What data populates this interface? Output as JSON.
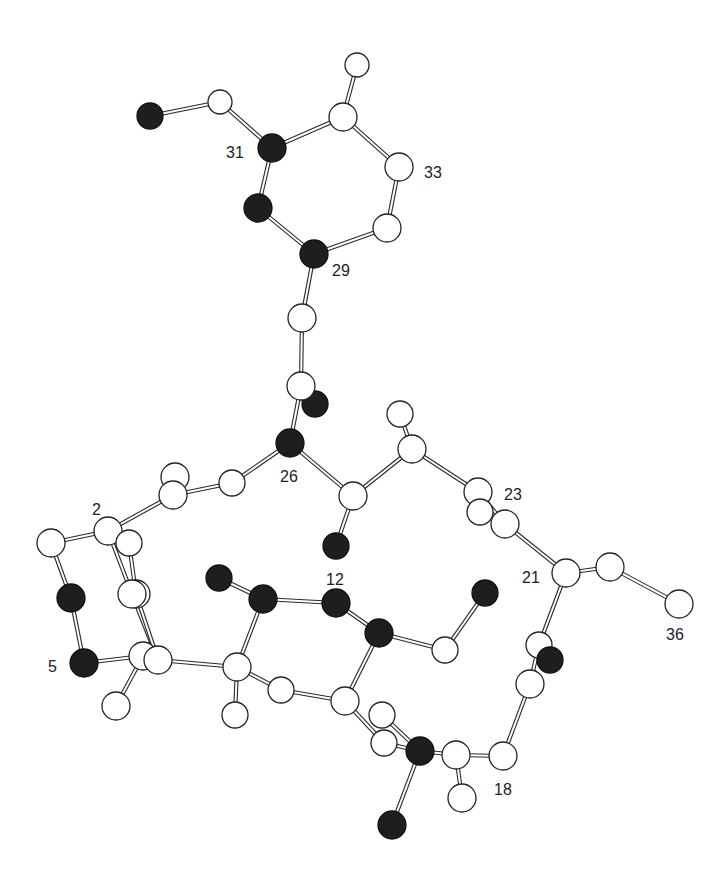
{
  "figure": {
    "type": "ball-and-stick molecular structure",
    "colors": {
      "background": "#ffffff",
      "light_atom": "#ffffff",
      "dark_atom": "#1e1e1e",
      "bond_outline": "#2a2a2a"
    }
  },
  "labels": [
    {
      "id": "lbl-31",
      "text": "31",
      "x": 226,
      "y": 158
    },
    {
      "id": "lbl-33",
      "text": "33",
      "x": 424,
      "y": 178
    },
    {
      "id": "lbl-29",
      "text": "29",
      "x": 332,
      "y": 276
    },
    {
      "id": "lbl-26",
      "text": "26",
      "x": 280,
      "y": 482
    },
    {
      "id": "lbl-23",
      "text": "23",
      "x": 504,
      "y": 500
    },
    {
      "id": "lbl-2",
      "text": "2",
      "x": 92,
      "y": 515
    },
    {
      "id": "lbl-12",
      "text": "12",
      "x": 326,
      "y": 585
    },
    {
      "id": "lbl-21",
      "text": "21",
      "x": 522,
      "y": 583
    },
    {
      "id": "lbl-36",
      "text": "36",
      "x": 666,
      "y": 640
    },
    {
      "id": "lbl-5",
      "text": "5",
      "x": 48,
      "y": 672
    },
    {
      "id": "lbl-18",
      "text": "18",
      "x": 494,
      "y": 795
    }
  ],
  "atoms": [
    {
      "id": "a1",
      "x": 150,
      "y": 116,
      "r": 13,
      "dark": true
    },
    {
      "id": "a2",
      "x": 220,
      "y": 102,
      "r": 12,
      "dark": false
    },
    {
      "id": "a3",
      "x": 357,
      "y": 65,
      "r": 12,
      "dark": false
    },
    {
      "id": "a4",
      "x": 343,
      "y": 117,
      "r": 14,
      "dark": false
    },
    {
      "id": "a31",
      "x": 272,
      "y": 148,
      "r": 14,
      "dark": true
    },
    {
      "id": "a33",
      "x": 399,
      "y": 167,
      "r": 14,
      "dark": false
    },
    {
      "id": "a5r",
      "x": 258,
      "y": 208,
      "r": 14,
      "dark": true
    },
    {
      "id": "a6r",
      "x": 387,
      "y": 228,
      "r": 14,
      "dark": false
    },
    {
      "id": "a29",
      "x": 314,
      "y": 254,
      "r": 14,
      "dark": true
    },
    {
      "id": "a7",
      "x": 302,
      "y": 318,
      "r": 14,
      "dark": false
    },
    {
      "id": "a8o",
      "x": 315,
      "y": 404,
      "r": 13,
      "dark": true
    },
    {
      "id": "a8",
      "x": 301,
      "y": 386,
      "r": 14,
      "dark": false
    },
    {
      "id": "a9",
      "x": 400,
      "y": 414,
      "r": 13,
      "dark": false
    },
    {
      "id": "a26",
      "x": 290,
      "y": 443,
      "r": 14,
      "dark": true
    },
    {
      "id": "a10",
      "x": 412,
      "y": 449,
      "r": 14,
      "dark": false
    },
    {
      "id": "a11",
      "x": 175,
      "y": 477,
      "r": 14,
      "dark": false
    },
    {
      "id": "a12",
      "x": 232,
      "y": 483,
      "r": 13,
      "dark": false
    },
    {
      "id": "a13",
      "x": 173,
      "y": 495,
      "r": 14,
      "dark": false
    },
    {
      "id": "a14",
      "x": 353,
      "y": 496,
      "r": 14,
      "dark": false
    },
    {
      "id": "a23",
      "x": 478,
      "y": 492,
      "r": 14,
      "dark": false
    },
    {
      "id": "a15",
      "x": 480,
      "y": 512,
      "r": 13,
      "dark": false
    },
    {
      "id": "a16",
      "x": 505,
      "y": 524,
      "r": 14,
      "dark": false
    },
    {
      "id": "a2n",
      "x": 108,
      "y": 531,
      "r": 14,
      "dark": false
    },
    {
      "id": "a17",
      "x": 129,
      "y": 543,
      "r": 13,
      "dark": false
    },
    {
      "id": "a18",
      "x": 51,
      "y": 543,
      "r": 14,
      "dark": false
    },
    {
      "id": "a19o",
      "x": 336,
      "y": 546,
      "r": 13,
      "dark": true
    },
    {
      "id": "a21",
      "x": 566,
      "y": 573,
      "r": 14,
      "dark": false
    },
    {
      "id": "a20",
      "x": 610,
      "y": 567,
      "r": 14,
      "dark": false
    },
    {
      "id": "a22",
      "x": 219,
      "y": 578,
      "r": 13,
      "dark": true
    },
    {
      "id": "a12a",
      "x": 263,
      "y": 599,
      "r": 14,
      "dark": true
    },
    {
      "id": "a24",
      "x": 336,
      "y": 603,
      "r": 14,
      "dark": true
    },
    {
      "id": "a25",
      "x": 71,
      "y": 598,
      "r": 14,
      "dark": true
    },
    {
      "id": "a27",
      "x": 485,
      "y": 593,
      "r": 13,
      "dark": true
    },
    {
      "id": "a28",
      "x": 136,
      "y": 594,
      "r": 14,
      "dark": false
    },
    {
      "id": "a36",
      "x": 679,
      "y": 604,
      "r": 14,
      "dark": false
    },
    {
      "id": "a30",
      "x": 132,
      "y": 594,
      "r": 14,
      "dark": false
    },
    {
      "id": "a32",
      "x": 379,
      "y": 633,
      "r": 14,
      "dark": true
    },
    {
      "id": "a34",
      "x": 445,
      "y": 650,
      "r": 13,
      "dark": false
    },
    {
      "id": "a35",
      "x": 539,
      "y": 645,
      "r": 13,
      "dark": false
    },
    {
      "id": "a37",
      "x": 550,
      "y": 660,
      "r": 13,
      "dark": true
    },
    {
      "id": "a5",
      "x": 84,
      "y": 663,
      "r": 14,
      "dark": true
    },
    {
      "id": "a38",
      "x": 143,
      "y": 656,
      "r": 14,
      "dark": false
    },
    {
      "id": "a39",
      "x": 158,
      "y": 660,
      "r": 14,
      "dark": false
    },
    {
      "id": "a40",
      "x": 237,
      "y": 667,
      "r": 14,
      "dark": false
    },
    {
      "id": "a41",
      "x": 530,
      "y": 684,
      "r": 14,
      "dark": false
    },
    {
      "id": "a42",
      "x": 281,
      "y": 690,
      "r": 13,
      "dark": false
    },
    {
      "id": "a43",
      "x": 345,
      "y": 701,
      "r": 14,
      "dark": false
    },
    {
      "id": "a44",
      "x": 116,
      "y": 706,
      "r": 14,
      "dark": false
    },
    {
      "id": "a45",
      "x": 235,
      "y": 715,
      "r": 13,
      "dark": false
    },
    {
      "id": "a46",
      "x": 382,
      "y": 715,
      "r": 13,
      "dark": false
    },
    {
      "id": "a47",
      "x": 384,
      "y": 743,
      "r": 13,
      "dark": false
    },
    {
      "id": "a48",
      "x": 420,
      "y": 751,
      "r": 14,
      "dark": true
    },
    {
      "id": "a49",
      "x": 456,
      "y": 755,
      "r": 14,
      "dark": false
    },
    {
      "id": "a18n",
      "x": 503,
      "y": 756,
      "r": 14,
      "dark": false
    },
    {
      "id": "a50",
      "x": 462,
      "y": 798,
      "r": 14,
      "dark": false
    },
    {
      "id": "a51",
      "x": 392,
      "y": 825,
      "r": 14,
      "dark": true
    }
  ],
  "bonds": [
    [
      "a1",
      "a2"
    ],
    [
      "a2",
      "a31"
    ],
    [
      "a31",
      "a4"
    ],
    [
      "a4",
      "a3"
    ],
    [
      "a4",
      "a33"
    ],
    [
      "a31",
      "a5r"
    ],
    [
      "a5r",
      "a29"
    ],
    [
      "a33",
      "a6r"
    ],
    [
      "a6r",
      "a29"
    ],
    [
      "a29",
      "a7"
    ],
    [
      "a7",
      "a8"
    ],
    [
      "a8",
      "a26"
    ],
    [
      "a26",
      "a12"
    ],
    [
      "a26",
      "a14"
    ],
    [
      "a14",
      "a10"
    ],
    [
      "a10",
      "a9"
    ],
    [
      "a10",
      "a23"
    ],
    [
      "a23",
      "a16"
    ],
    [
      "a16",
      "a21"
    ],
    [
      "a21",
      "a20"
    ],
    [
      "a20",
      "a36"
    ],
    [
      "a14",
      "a19o"
    ],
    [
      "a12",
      "a13"
    ],
    [
      "a13",
      "a2n"
    ],
    [
      "a2n",
      "a18"
    ],
    [
      "a18",
      "a25"
    ],
    [
      "a25",
      "a5"
    ],
    [
      "a5",
      "a38"
    ],
    [
      "a2n",
      "a17"
    ],
    [
      "a17",
      "a28"
    ],
    [
      "a2n",
      "a30"
    ],
    [
      "a30",
      "a39"
    ],
    [
      "a28",
      "a39"
    ],
    [
      "a38",
      "a44"
    ],
    [
      "a39",
      "a40"
    ],
    [
      "a22",
      "a12a"
    ],
    [
      "a12a",
      "a24"
    ],
    [
      "a24",
      "a32"
    ],
    [
      "a32",
      "a34"
    ],
    [
      "a34",
      "a27"
    ],
    [
      "a12a",
      "a40"
    ],
    [
      "a40",
      "a45"
    ],
    [
      "a40",
      "a42"
    ],
    [
      "a42",
      "a43"
    ],
    [
      "a43",
      "a32"
    ],
    [
      "a43",
      "a47"
    ],
    [
      "a47",
      "a48"
    ],
    [
      "a46",
      "a48"
    ],
    [
      "a48",
      "a49"
    ],
    [
      "a49",
      "a18n"
    ],
    [
      "a49",
      "a50"
    ],
    [
      "a48",
      "a51"
    ],
    [
      "a18n",
      "a41"
    ],
    [
      "a41",
      "a35"
    ],
    [
      "a35",
      "a21"
    ]
  ]
}
